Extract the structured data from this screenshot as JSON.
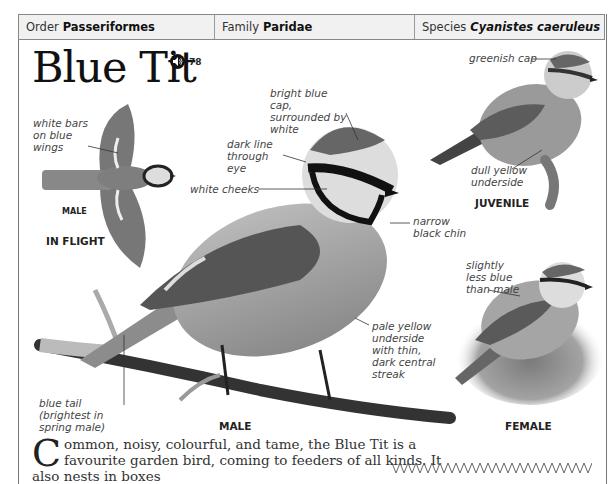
{
  "header": {
    "order_label": "Order",
    "order_value": "Passeriformes",
    "family_label": "Family",
    "family_value": "Paridae",
    "species_label": "Species",
    "species_value": "Cyanistes caeruleus"
  },
  "title": "Blue Tit",
  "audio": {
    "icon": "speaker-icon",
    "track": "78"
  },
  "annotations": {
    "wing_bars": "white bars on blue wings",
    "cap": "bright blue cap, surrounded by white",
    "eye_line": "dark line through eye",
    "cheeks": "white cheeks",
    "chin": "narrow black chin",
    "underside": "pale yellow underside with thin, dark central streak",
    "tail": "blue tail (brightest in spring male)",
    "juv_cap": "greenish cap",
    "juv_underside": "dull yellow underside",
    "female": "slightly less blue than male"
  },
  "captions": {
    "flight_male": "MALE",
    "in_flight": "IN FLIGHT",
    "male": "MALE",
    "juvenile": "JUVENILE",
    "female": "FEMALE"
  },
  "body": {
    "dropcap": "C",
    "text": "ommon, noisy, colourful, and tame, the Blue Tit is a favourite garden bird, coming to feeders of all kinds. It also nests in boxes"
  },
  "colors": {
    "header_bg": "#f1f1f1",
    "border": "#888888",
    "text": "#222222"
  }
}
